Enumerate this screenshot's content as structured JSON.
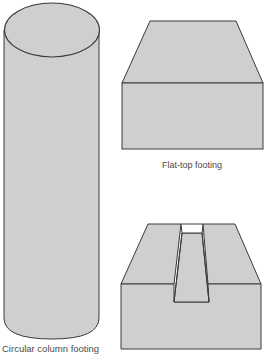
{
  "figure": {
    "kind": "footing shapes illustration",
    "fill_color": "#cfcfcf",
    "stroke_color": "#3a3a3a",
    "shapes": [
      {
        "id": "circular-column-footing",
        "label": "Circular column footing"
      },
      {
        "id": "flat-top-footing",
        "label": "Flat-top footing"
      },
      {
        "id": "keyed-footing",
        "label": ""
      }
    ]
  },
  "labels": {
    "circular": "Circular column footing",
    "flat_top": "Flat-top footing"
  }
}
